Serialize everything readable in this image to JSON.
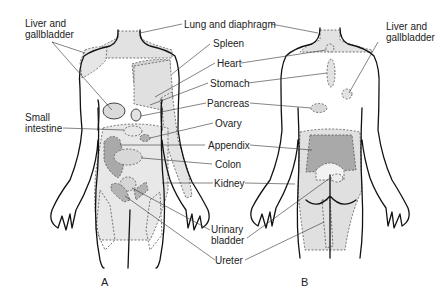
{
  "figure": {
    "panels": [
      {
        "id": "A",
        "label": "A",
        "view": "anterior"
      },
      {
        "id": "B",
        "label": "B",
        "view": "posterior"
      }
    ],
    "labels": {
      "liver_gallbladder_front": "Liver and\ngallbladder",
      "lung_diaphragm": "Lung and diaphragm",
      "spleen": "Spleen",
      "heart": "Heart",
      "stomach": "Stomach",
      "pancreas": "Pancreas",
      "small_intestine": "Small\nintestine",
      "ovary": "Ovary",
      "appendix": "Appendix",
      "colon": "Colon",
      "kidney": "Kidney",
      "urinary_bladder": "Urinary\nbladder",
      "ureter": "Ureter",
      "liver_gallbladder_back": "Liver and\ngallbladder"
    },
    "colors": {
      "light_shade": "#e2e2e2",
      "mid_shade": "#d3d3d3",
      "dark_shade": "#a9a9a9",
      "outline": "#111111"
    }
  }
}
